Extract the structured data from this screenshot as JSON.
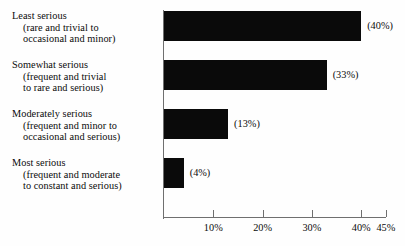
{
  "chart_data": {
    "type": "bar",
    "orientation": "horizontal",
    "title": "",
    "xlabel": "",
    "ylabel": "",
    "xlim": [
      0,
      45
    ],
    "grid": false,
    "legend": null,
    "categories": [
      "Least serious (rare and trivial to occasional and minor)",
      "Somewhat serious (frequent and trivial to rare and serious)",
      "Moderately serious (frequent and minor to occasional and serious)",
      "Most serious (frequent and moderate to constant and serious)"
    ],
    "values": [
      40,
      33,
      13,
      4
    ],
    "value_labels": [
      "(40%)",
      "(33%)",
      "(13%)",
      "(4%)"
    ],
    "tick_values": [
      10,
      20,
      30,
      40,
      45
    ],
    "tick_labels": [
      "10%",
      "20%",
      "30%",
      "40%",
      "45%"
    ]
  },
  "categories_detail": [
    {
      "line1": "Least serious",
      "line2": "(rare and trivial to",
      "line3": "occasional and minor)",
      "value_label": "(40%)"
    },
    {
      "line1": "Somewhat serious",
      "line2": "(frequent and trivial",
      "line3": "to rare and serious)",
      "value_label": "(33%)"
    },
    {
      "line1": "Moderately serious",
      "line2": "(frequent and minor to",
      "line3": "occasional and serious)",
      "value_label": "(13%)"
    },
    {
      "line1": "Most serious",
      "line2": "(frequent and moderate",
      "line3": "to constant and serious)",
      "value_label": "(4%)"
    }
  ],
  "axis": {
    "tick_labels": [
      "10%",
      "20%",
      "30%",
      "40%",
      "45%"
    ]
  },
  "colors": {
    "bar": "#0a0a0a",
    "axis": "#6f6f6f",
    "text": "#0b0b0b",
    "background": "#fefefe"
  }
}
